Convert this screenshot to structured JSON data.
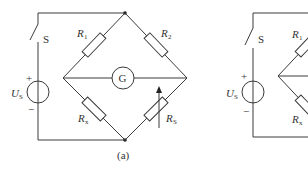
{
  "figure": {
    "caption_a": "(a)",
    "circuit_a": {
      "switch_label": "S",
      "source_label": "U",
      "source_sub": "S",
      "plus": "+",
      "minus": "−",
      "galvanometer": "G",
      "r1": {
        "main": "R",
        "sub": "1"
      },
      "r2": {
        "main": "R",
        "sub": "2"
      },
      "rx": {
        "main": "R",
        "sub": "x"
      },
      "rs": {
        "main": "R",
        "sub": "S"
      }
    },
    "circuit_b_partial": {
      "switch_label": "S",
      "source_label": "U",
      "source_sub": "S",
      "plus": "+",
      "minus": "−",
      "r1": {
        "main": "R",
        "sub": "1"
      },
      "rx": {
        "main": "R",
        "sub": "x"
      }
    }
  },
  "colors": {
    "line": "#3a3a3a",
    "background": "#ffffff"
  }
}
